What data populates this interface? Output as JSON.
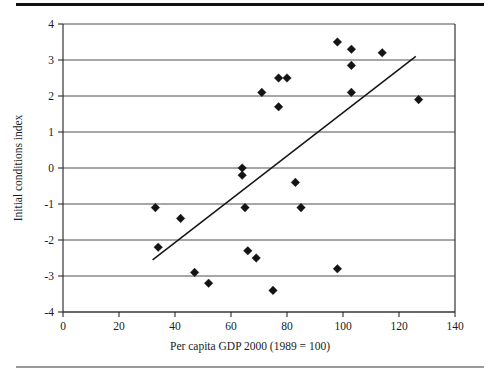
{
  "chart_data": {
    "type": "scatter",
    "title": "",
    "xlabel": "Per capita GDP 2000 (1989 = 100)",
    "ylabel": "Initial conditions index",
    "xlim": [
      0,
      140
    ],
    "ylim": [
      -4,
      4
    ],
    "xticks": [
      0,
      20,
      40,
      60,
      80,
      100,
      120,
      140
    ],
    "yticks": [
      -4,
      -3,
      -2,
      -1,
      0,
      1,
      2,
      3,
      4
    ],
    "xtick_labels": [
      "0",
      "20",
      "40",
      "60",
      "80",
      "100",
      "120",
      "140"
    ],
    "ytick_labels": [
      "-4",
      "-3",
      "-2",
      "-1",
      "0",
      "1",
      "2",
      "3",
      "4"
    ],
    "grid": "horizontal",
    "legend": "none",
    "points": [
      {
        "x": 33,
        "y": -1.1
      },
      {
        "x": 34,
        "y": -2.2
      },
      {
        "x": 42,
        "y": -1.4
      },
      {
        "x": 47,
        "y": -2.9
      },
      {
        "x": 52,
        "y": -3.2
      },
      {
        "x": 64,
        "y": 0.0
      },
      {
        "x": 64,
        "y": -0.2
      },
      {
        "x": 65,
        "y": -1.1
      },
      {
        "x": 66,
        "y": -2.3
      },
      {
        "x": 69,
        "y": -2.5
      },
      {
        "x": 71,
        "y": 2.1
      },
      {
        "x": 75,
        "y": -3.4
      },
      {
        "x": 77,
        "y": 2.5
      },
      {
        "x": 77,
        "y": 1.7
      },
      {
        "x": 80,
        "y": 2.5
      },
      {
        "x": 83,
        "y": -0.4
      },
      {
        "x": 85,
        "y": -1.1
      },
      {
        "x": 98,
        "y": 3.5
      },
      {
        "x": 98,
        "y": -2.8
      },
      {
        "x": 103,
        "y": 3.3
      },
      {
        "x": 103,
        "y": 2.85
      },
      {
        "x": 103,
        "y": 2.1
      },
      {
        "x": 114,
        "y": 3.2
      },
      {
        "x": 127,
        "y": 1.9
      }
    ],
    "trend_line": {
      "x_start": 32,
      "y_start": -2.55,
      "x_end": 126,
      "y_end": 3.1,
      "style": "solid"
    },
    "series_name": "countries"
  }
}
